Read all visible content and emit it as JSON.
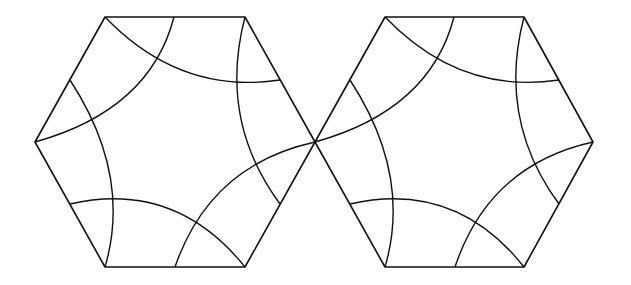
{
  "figure": {
    "stroke_color": "#111111",
    "background": "#ffffff",
    "shapes": [
      {
        "name": "left-hexagon",
        "vertices": [
          [
            105,
            17
          ],
          [
            245,
            17
          ],
          [
            315,
            142
          ],
          [
            245,
            267
          ],
          [
            105,
            267
          ],
          [
            35,
            142
          ]
        ],
        "arcs": [
          {
            "from": [
              105,
              17
            ],
            "ctrl": [
              180,
              95
            ],
            "to": [
              280,
              80
            ]
          },
          {
            "from": [
              174,
              17
            ],
            "ctrl": [
              150,
              110
            ],
            "to": [
              35,
              142
            ]
          },
          {
            "from": [
              245,
              17
            ],
            "ctrl": [
              218,
              120
            ],
            "to": [
              280,
              204
            ]
          },
          {
            "from": [
              315,
              142
            ],
            "ctrl": [
              210,
              165
            ],
            "to": [
              175,
              267
            ]
          },
          {
            "from": [
              245,
              267
            ],
            "ctrl": [
              175,
              180
            ],
            "to": [
              70,
              204
            ]
          },
          {
            "from": [
              105,
              267
            ],
            "ctrl": [
              132,
              175
            ],
            "to": [
              70,
              80
            ]
          }
        ]
      },
      {
        "name": "right-hexagon",
        "vertices": [
          [
            385,
            17
          ],
          [
            524,
            17
          ],
          [
            593,
            142
          ],
          [
            524,
            267
          ],
          [
            385,
            267
          ],
          [
            315,
            142
          ]
        ],
        "arcs": [
          {
            "from": [
              385,
              17
            ],
            "ctrl": [
              460,
              95
            ],
            "to": [
              559,
              80
            ]
          },
          {
            "from": [
              454,
              17
            ],
            "ctrl": [
              430,
              110
            ],
            "to": [
              315,
              142
            ]
          },
          {
            "from": [
              524,
              17
            ],
            "ctrl": [
              497,
              120
            ],
            "to": [
              559,
              204
            ]
          },
          {
            "from": [
              593,
              142
            ],
            "ctrl": [
              489,
              165
            ],
            "to": [
              455,
              267
            ]
          },
          {
            "from": [
              524,
              267
            ],
            "ctrl": [
              455,
              180
            ],
            "to": [
              350,
              204
            ]
          },
          {
            "from": [
              385,
              267
            ],
            "ctrl": [
              412,
              175
            ],
            "to": [
              350,
              80
            ]
          }
        ]
      }
    ]
  }
}
